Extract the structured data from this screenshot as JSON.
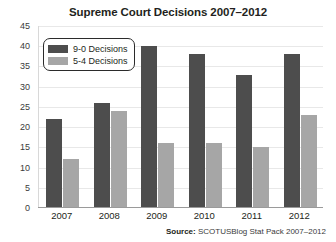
{
  "chart_data": {
    "type": "bar",
    "title": "Supreme Court Decisions 2007–2012",
    "xlabel": "",
    "ylabel": "",
    "categories": [
      "2007",
      "2008",
      "2009",
      "2010",
      "2011",
      "2012"
    ],
    "series": [
      {
        "name": "9-0 Decisions",
        "color": "#4d4d4d",
        "values": [
          22,
          26,
          40,
          38,
          33,
          38
        ]
      },
      {
        "name": "5-4 Decisions",
        "color": "#a6a6a6",
        "values": [
          12,
          24,
          16,
          16,
          15,
          23
        ]
      }
    ],
    "ylim": [
      0,
      45
    ],
    "ytick_step": 5,
    "yticks": [
      "45",
      "40",
      "35",
      "30",
      "25",
      "20",
      "15",
      "10",
      "5",
      "0"
    ],
    "grid": true,
    "legend_position": "top-left"
  },
  "source": {
    "label": "Source:",
    "text": " SCOTUSBlog Stat Pack 2007–2012"
  }
}
